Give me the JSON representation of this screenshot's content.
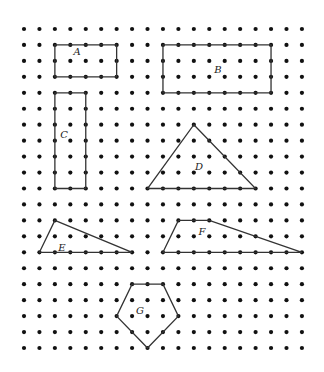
{
  "grid": {
    "columns": 19,
    "rows": 21,
    "origin_x": 24,
    "origin_y": 29,
    "spacing_x": 15.44,
    "spacing_y": 15.95,
    "dot_radius": 2.1,
    "dot_color": "#111111"
  },
  "shapes": [
    {
      "name": "A",
      "label": "A",
      "vertices": [
        [
          2,
          1
        ],
        [
          6,
          1
        ],
        [
          6,
          3
        ],
        [
          2,
          3
        ]
      ],
      "label_pos": [
        77,
        52
      ]
    },
    {
      "name": "B",
      "label": "B",
      "vertices": [
        [
          9,
          1
        ],
        [
          16,
          1
        ],
        [
          16,
          4
        ],
        [
          9,
          4
        ]
      ],
      "label_pos": [
        218,
        70
      ]
    },
    {
      "name": "C",
      "label": "C",
      "vertices": [
        [
          2,
          4
        ],
        [
          4,
          4
        ],
        [
          4,
          10
        ],
        [
          2,
          10
        ]
      ],
      "label_pos": [
        64,
        135
      ]
    },
    {
      "name": "D",
      "label": "D",
      "vertices": [
        [
          11,
          6
        ],
        [
          15,
          10
        ],
        [
          8,
          10
        ]
      ],
      "label_pos": [
        199,
        167
      ]
    },
    {
      "name": "E",
      "label": "E",
      "vertices": [
        [
          2,
          12
        ],
        [
          7,
          14
        ],
        [
          1,
          14
        ]
      ],
      "label_pos": [
        62,
        248
      ]
    },
    {
      "name": "F",
      "label": "F",
      "vertices": [
        [
          10,
          12
        ],
        [
          12,
          12
        ],
        [
          18,
          14
        ],
        [
          9,
          14
        ]
      ],
      "label_pos": [
        202,
        232
      ]
    },
    {
      "name": "G",
      "label": "G",
      "vertices": [
        [
          7,
          16
        ],
        [
          9,
          16
        ],
        [
          10,
          18
        ],
        [
          8,
          20
        ],
        [
          6,
          18
        ]
      ],
      "label_pos": [
        140,
        311
      ]
    }
  ]
}
